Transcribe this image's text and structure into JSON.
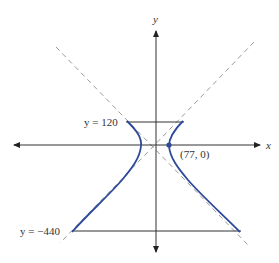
{
  "figure": {
    "type": "hyperbola-diagram",
    "axes": {
      "x_label": "x",
      "y_label": "y"
    },
    "labels": {
      "top_line": "y = 120",
      "bottom_line": "y = −440",
      "vertex": "(77, 0)"
    },
    "colors": {
      "curve": "#2d4a9a",
      "axis": "#333333",
      "asymptote": "#999999",
      "line": "#333333"
    }
  }
}
